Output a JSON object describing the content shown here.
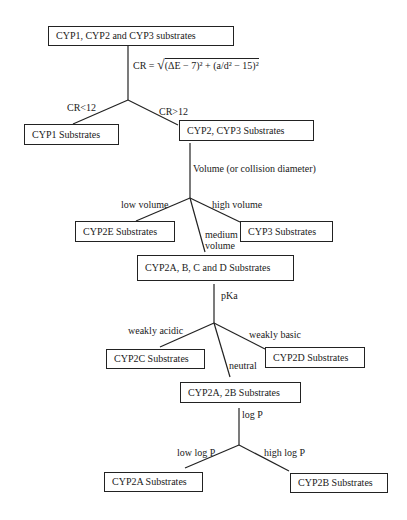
{
  "diagram": {
    "nodes": [
      {
        "id": "root",
        "label": "CYP1, CYP2 and CYP3 substrates"
      },
      {
        "id": "cyp1",
        "label": "CYP1 Substrates"
      },
      {
        "id": "cyp2_3",
        "label": "CYP2, CYP3 Substrates"
      },
      {
        "id": "cyp2e",
        "label": "CYP2E Substrates"
      },
      {
        "id": "cyp3",
        "label": "CYP3 Substrates"
      },
      {
        "id": "cyp2abcd",
        "label": "CYP2A, B, C and D Substrates"
      },
      {
        "id": "cyp2c",
        "label": "CYP2C Substrates"
      },
      {
        "id": "cyp2d",
        "label": "CYP2D Substrates"
      },
      {
        "id": "cyp2a_2b",
        "label": "CYP2A, 2B Substrates"
      },
      {
        "id": "cyp2a",
        "label": "CYP2A Substrates"
      },
      {
        "id": "cyp2b",
        "label": "CYP2B Substrates"
      }
    ],
    "criteria": {
      "cr_formula_prefix": "CR = ",
      "cr_formula_body": "(ΔE − 7)² + (a/d² − 15)²",
      "volume": "Volume (or collision diameter)",
      "pka": "pKa",
      "logp": "log P"
    },
    "edges": {
      "cr_low": "CR<12",
      "cr_high": "CR>12",
      "low_volume": "low volume",
      "high_volume": "high volume",
      "medium_volume_1": "medium",
      "medium_volume_2": "volume",
      "weakly_acidic": "weakly acidic",
      "weakly_basic": "weakly basic",
      "neutral": "neutral",
      "low_logp": "low log P",
      "high_logp": "high log P"
    }
  }
}
